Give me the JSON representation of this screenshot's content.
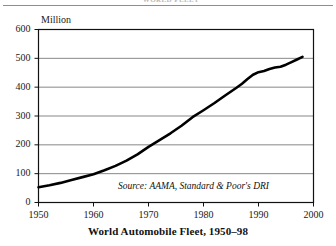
{
  "header": {
    "ghost_text": "WORLD FLEET",
    "rule": "horizontal-rule"
  },
  "chart_data": {
    "type": "line",
    "caption": "World Automobile Fleet, 1950–98",
    "unit_label": "Million",
    "xlabel": "",
    "ylabel": "Million",
    "source": "Source: AAMA, Standard & Poor's DRI",
    "xlim": [
      1950,
      2000
    ],
    "ylim": [
      0,
      600
    ],
    "grid": true,
    "legend": "none",
    "xticks": [
      1950,
      1960,
      1970,
      1980,
      1990,
      2000
    ],
    "yticks": [
      0,
      100,
      200,
      300,
      400,
      500,
      600
    ],
    "xtick_labels": [
      "1950",
      "1960",
      "1970",
      "1980",
      "1990",
      "2000"
    ],
    "ytick_labels": [
      "0",
      "100",
      "200",
      "300",
      "400",
      "500",
      "600"
    ],
    "series": [
      {
        "name": "World automobile fleet",
        "x": [
          1950,
          1952,
          1954,
          1956,
          1958,
          1960,
          1962,
          1964,
          1966,
          1968,
          1970,
          1972,
          1974,
          1976,
          1978,
          1980,
          1982,
          1984,
          1986,
          1987,
          1988,
          1989,
          1990,
          1991,
          1992,
          1993,
          1994,
          1995,
          1996,
          1997,
          1998
        ],
        "values": [
          53,
          60,
          68,
          78,
          88,
          98,
          112,
          127,
          145,
          167,
          193,
          216,
          240,
          266,
          296,
          320,
          345,
          372,
          398,
          412,
          428,
          443,
          452,
          456,
          463,
          468,
          471,
          478,
          487,
          496,
          505
        ]
      }
    ]
  }
}
